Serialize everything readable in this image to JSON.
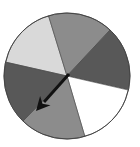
{
  "spinner": {
    "center": [
      67,
      76
    ],
    "radius": 63,
    "outline_color": "#444444",
    "sectors": [
      {
        "name": "light-gray-sector-top-left",
        "color": "#d9d9d9",
        "from": [
          5,
          62
        ],
        "to": [
          48,
          14
        ]
      },
      {
        "name": "medium-gray-sector-top",
        "color": "#8c8c8c",
        "from": [
          48,
          14
        ],
        "to": [
          110,
          30
        ]
      },
      {
        "name": "dark-gray-sector-right",
        "color": "#585858",
        "from": [
          110,
          30
        ],
        "to": [
          128,
          90
        ]
      },
      {
        "name": "white-sector-bottom-right",
        "color": "#ffffff",
        "from": [
          128,
          90
        ],
        "to": [
          85,
          137
        ]
      },
      {
        "name": "medium-gray-sector-bottom",
        "color": "#8c8c8c",
        "from": [
          85,
          137
        ],
        "to": [
          24,
          120
        ]
      },
      {
        "name": "dark-gray-sector-left",
        "color": "#585858",
        "from": [
          24,
          120
        ],
        "to": [
          5,
          62
        ]
      }
    ],
    "arrow": {
      "color": "#111111",
      "tail": [
        69,
        74
      ],
      "tip": [
        36,
        111
      ],
      "direction": "lower-left"
    }
  }
}
